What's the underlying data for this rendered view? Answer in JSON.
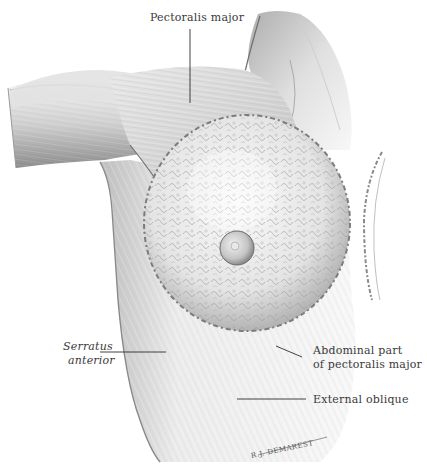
{
  "figure": {
    "type": "anatomical-illustration",
    "palette": {
      "background": "#ffffff",
      "ink": "#3a3a3a",
      "muscle_light": "#e6e6e6",
      "muscle_mid": "#bdbdbd",
      "muscle_dark": "#7a7a7a",
      "gland": "#f2f2f2",
      "gland_shadow": "#9a9a9a"
    }
  },
  "labels": {
    "pectoralis_major": "Pectoralis major",
    "serratus_line1": "Serratus",
    "serratus_line2": "anterior",
    "abdominal_line1": "Abdominal part",
    "abdominal_line2": "of pectoralis major",
    "external_oblique": "External oblique"
  },
  "signature": "R.J. DEMAREST"
}
